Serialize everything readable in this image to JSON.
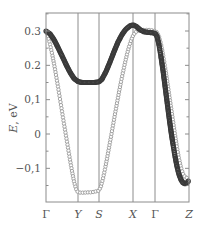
{
  "chart_data": {
    "type": "scatter",
    "title": "",
    "xlabel": "",
    "ylabel": "E, eV",
    "ylabel_italic_part": "E",
    "ylabel_rest": ", eV",
    "ylim": [
      -0.195,
      0.35
    ],
    "yticks": [
      0.3,
      0.2,
      0.1,
      0,
      -0.1
    ],
    "ytick_labels": [
      "0.3",
      "0.2",
      "0,1",
      "0",
      "−0,1"
    ],
    "grid": false,
    "legend": null,
    "x_high_symmetry_points": [
      {
        "label": "Γ",
        "k": 0,
        "italic": false
      },
      {
        "label": "Y",
        "k": 32,
        "italic": true
      },
      {
        "label": "S",
        "k": 53,
        "italic": true
      },
      {
        "label": "X",
        "k": 87,
        "italic": true
      },
      {
        "label": "Γ",
        "k": 109,
        "italic": false
      },
      {
        "label": "Z",
        "k": 143,
        "italic": true
      }
    ],
    "xlim": [
      0,
      143
    ],
    "series": [
      {
        "name": "band-dark",
        "style": "filled-dense-markers",
        "color": "#3a3a3a",
        "points": [
          [
            0,
            0.3
          ],
          [
            4,
            0.292
          ],
          [
            8,
            0.275
          ],
          [
            12,
            0.252
          ],
          [
            16,
            0.228
          ],
          [
            20,
            0.203
          ],
          [
            24,
            0.18
          ],
          [
            28,
            0.162
          ],
          [
            32,
            0.153
          ],
          [
            36,
            0.15
          ],
          [
            40,
            0.15
          ],
          [
            44,
            0.15
          ],
          [
            48,
            0.15
          ],
          [
            53,
            0.152
          ],
          [
            56,
            0.16
          ],
          [
            60,
            0.182
          ],
          [
            64,
            0.21
          ],
          [
            68,
            0.24
          ],
          [
            72,
            0.268
          ],
          [
            76,
            0.29
          ],
          [
            80,
            0.306
          ],
          [
            84,
            0.315
          ],
          [
            87,
            0.318
          ],
          [
            90,
            0.314
          ],
          [
            94,
            0.304
          ],
          [
            98,
            0.298
          ],
          [
            102,
            0.296
          ],
          [
            106,
            0.295
          ],
          [
            109,
            0.294
          ],
          [
            111,
            0.285
          ],
          [
            113,
            0.26
          ],
          [
            115,
            0.225
          ],
          [
            117,
            0.185
          ],
          [
            119,
            0.14
          ],
          [
            121,
            0.095
          ],
          [
            123,
            0.05
          ],
          [
            125,
            0.008
          ],
          [
            127,
            -0.03
          ],
          [
            129,
            -0.065
          ],
          [
            131,
            -0.095
          ],
          [
            133,
            -0.118
          ],
          [
            135,
            -0.133
          ],
          [
            137,
            -0.142
          ],
          [
            139,
            -0.145
          ],
          [
            141,
            -0.142
          ],
          [
            143,
            -0.135
          ]
        ]
      },
      {
        "name": "band-light",
        "style": "open-circles",
        "color": "#9a9a9a",
        "points": [
          [
            0,
            0.3
          ],
          [
            2,
            0.285
          ],
          [
            4,
            0.262
          ],
          [
            6,
            0.235
          ],
          [
            8,
            0.205
          ],
          [
            10,
            0.172
          ],
          [
            12,
            0.138
          ],
          [
            14,
            0.102
          ],
          [
            16,
            0.066
          ],
          [
            18,
            0.03
          ],
          [
            20,
            -0.005
          ],
          [
            22,
            -0.04
          ],
          [
            24,
            -0.075
          ],
          [
            26,
            -0.108
          ],
          [
            28,
            -0.138
          ],
          [
            30,
            -0.16
          ],
          [
            32,
            -0.17
          ],
          [
            35,
            -0.171
          ],
          [
            38,
            -0.171
          ],
          [
            41,
            -0.17
          ],
          [
            44,
            -0.17
          ],
          [
            47,
            -0.169
          ],
          [
            50,
            -0.167
          ],
          [
            53,
            -0.165
          ],
          [
            55,
            -0.152
          ],
          [
            57,
            -0.13
          ],
          [
            59,
            -0.102
          ],
          [
            61,
            -0.072
          ],
          [
            63,
            -0.04
          ],
          [
            65,
            -0.008
          ],
          [
            67,
            0.025
          ],
          [
            69,
            0.058
          ],
          [
            71,
            0.09
          ],
          [
            73,
            0.122
          ],
          [
            75,
            0.152
          ],
          [
            77,
            0.18
          ],
          [
            79,
            0.207
          ],
          [
            81,
            0.232
          ],
          [
            83,
            0.254
          ],
          [
            85,
            0.272
          ],
          [
            87,
            0.286
          ],
          [
            89,
            0.295
          ],
          [
            91,
            0.3
          ],
          [
            94,
            0.302
          ],
          [
            97,
            0.303
          ],
          [
            100,
            0.303
          ],
          [
            103,
            0.303
          ],
          [
            106,
            0.302
          ],
          [
            109,
            0.3
          ],
          [
            111,
            0.296
          ],
          [
            113,
            0.284
          ],
          [
            115,
            0.262
          ],
          [
            117,
            0.232
          ],
          [
            119,
            0.196
          ],
          [
            121,
            0.158
          ],
          [
            123,
            0.118
          ],
          [
            125,
            0.078
          ],
          [
            127,
            0.038
          ],
          [
            129,
            -0.002
          ],
          [
            131,
            -0.04
          ],
          [
            133,
            -0.072
          ],
          [
            135,
            -0.098
          ],
          [
            137,
            -0.116
          ],
          [
            139,
            -0.125
          ],
          [
            141,
            -0.128
          ],
          [
            143,
            -0.128
          ]
        ]
      }
    ]
  },
  "layout": {
    "frame": {
      "x0": 46,
      "x1": 189,
      "y0": 13,
      "y1": 202
    },
    "y_ref_value": 0.3,
    "y_ref_px": 31,
    "y_zero_px": 134,
    "colors": {
      "frame": "#8c8c8c",
      "vline": "#8c8c8c",
      "text": "#555555"
    }
  }
}
